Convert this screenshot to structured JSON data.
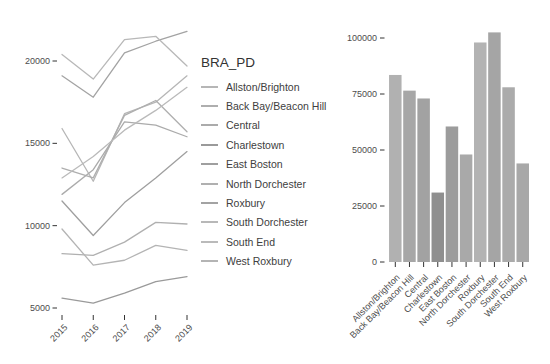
{
  "legend": {
    "title": "BRA_PD"
  },
  "colors": {
    "tick_mark": "#333333",
    "tick_label": "#4d4d4d",
    "background": "#ffffff"
  },
  "chart_data": [
    {
      "type": "line",
      "title": "",
      "xlabel": "",
      "ylabel": "",
      "x": [
        2015,
        2016,
        2017,
        2018,
        2019
      ],
      "x_ticks": [
        {
          "v": 2015,
          "label": "2015"
        },
        {
          "v": 2016,
          "label": "2016"
        },
        {
          "v": 2017,
          "label": "2017"
        },
        {
          "v": 2018,
          "label": "2018"
        },
        {
          "v": 2019,
          "label": "2019"
        }
      ],
      "y_ticks": [
        {
          "v": 5000,
          "label": "5000"
        },
        {
          "v": 10000,
          "label": "10000"
        },
        {
          "v": 15000,
          "label": "15000"
        },
        {
          "v": 20000,
          "label": "20000"
        }
      ],
      "ylim": [
        4400,
        22700
      ],
      "grid": false,
      "legend_position": "right",
      "series": [
        {
          "name": "Allston/Brighton",
          "slug": "allston-brighton",
          "values": [
            15900,
            12700,
            16800,
            17500,
            19100
          ],
          "color": "#b6b6b6"
        },
        {
          "name": "Back Bay/Beacon Hill",
          "slug": "back-bay-beacon-hill",
          "values": [
            13500,
            12900,
            16700,
            17600,
            15700
          ],
          "color": "#aeaeae"
        },
        {
          "name": "Central",
          "slug": "central",
          "values": [
            11900,
            13400,
            16300,
            16100,
            15400
          ],
          "color": "#ababab"
        },
        {
          "name": "Charlestown",
          "slug": "charlestown",
          "values": [
            5600,
            5300,
            5900,
            6600,
            6900
          ],
          "color": "#9a9a9a"
        },
        {
          "name": "East Boston",
          "slug": "east-boston",
          "values": [
            11500,
            9400,
            11400,
            12900,
            14500
          ],
          "color": "#9f9f9f"
        },
        {
          "name": "North Dorchester",
          "slug": "north-dorchester",
          "values": [
            8300,
            8200,
            9000,
            10200,
            10100
          ],
          "color": "#b0b0b0"
        },
        {
          "name": "Roxbury",
          "slug": "roxbury",
          "values": [
            19100,
            17800,
            20500,
            21200,
            21800
          ],
          "color": "#a3a3a3"
        },
        {
          "name": "South Dorchester",
          "slug": "south-dorchester",
          "values": [
            20400,
            18900,
            21300,
            21500,
            19700
          ],
          "color": "#b8b8b8"
        },
        {
          "name": "South End",
          "slug": "south-end",
          "values": [
            12900,
            14200,
            15800,
            17000,
            18400
          ],
          "color": "#bababa"
        },
        {
          "name": "West Roxbury",
          "slug": "west-roxbury",
          "values": [
            9800,
            7600,
            7900,
            8800,
            8500
          ],
          "color": "#b4b4b4"
        }
      ]
    },
    {
      "type": "bar",
      "title": "",
      "xlabel": "",
      "ylabel": "",
      "categories": [
        "Allston/Brighton",
        "Back Bay/Beacon Hill",
        "Central",
        "Charlestown",
        "East Boston",
        "North Dorchester",
        "Roxbury",
        "South Dorchester",
        "South End",
        "West Roxbury"
      ],
      "slugs": [
        "allston-brighton",
        "back-bay-beacon-hill",
        "central",
        "charlestown",
        "east-boston",
        "north-dorchester",
        "roxbury",
        "south-dorchester",
        "south-end",
        "west-roxbury"
      ],
      "values": [
        83500,
        76500,
        73000,
        31000,
        60500,
        48000,
        98000,
        102500,
        78000,
        44000
      ],
      "colors": [
        "#b1b1b1",
        "#a7a7a7",
        "#a2a2a2",
        "#8f8f8f",
        "#9c9c9c",
        "#a9a9a9",
        "#b3b3b3",
        "#a5a5a5",
        "#ababab",
        "#a8a8a8"
      ],
      "y_ticks": [
        {
          "v": 0,
          "label": "0"
        },
        {
          "v": 25000,
          "label": "25000"
        },
        {
          "v": 50000,
          "label": "50000"
        },
        {
          "v": 75000,
          "label": "75000"
        },
        {
          "v": 100000,
          "label": "100000"
        }
      ],
      "ylim": [
        0,
        107600
      ],
      "grid": false
    }
  ]
}
